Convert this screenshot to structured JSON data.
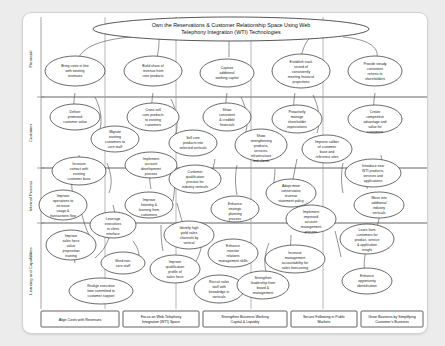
{
  "diagram": {
    "type": "strategy-map",
    "title": "Own the Reservations & Customer Relationship Space Using Web Telephony Integration (WTI) Technologies",
    "background_color": "#ececed",
    "panel_color": "#ffffff",
    "line_color": "#4a4a4a"
  },
  "perspectives": [
    {
      "id": "financial",
      "label": "Financial"
    },
    {
      "id": "customer",
      "label": "Customer"
    },
    {
      "id": "internal",
      "label": "Internal Process"
    },
    {
      "id": "learning",
      "label": "Learning and Capabilities"
    }
  ],
  "themes": [
    {
      "id": "theme-1",
      "label": "Align Costs with Revenues"
    },
    {
      "id": "theme-2",
      "label": "Focus on Web-Telephony Integration (WTI) Space"
    },
    {
      "id": "theme-3",
      "label": "Strengthen Business Working Capital & Liquidity"
    },
    {
      "id": "theme-4",
      "label": "Secure Following in Public Markets"
    },
    {
      "id": "theme-5",
      "label": "Grow Business by Simplifying Customer's Business"
    }
  ],
  "nodes": {
    "financial": [
      {
        "id": "f1",
        "label": "Bring costs in line with existing revenues"
      },
      {
        "id": "f2",
        "label": "Build share of revenue from core products"
      },
      {
        "id": "f3",
        "label": "Capture additional working capital"
      },
      {
        "id": "f4",
        "label": "Establish track record of consistently meeting financial projections"
      },
      {
        "id": "f5",
        "label": "Provide steady consistent returns to shareholders"
      }
    ],
    "customer": [
      {
        "id": "c1",
        "label": "Deliver promised customer value"
      },
      {
        "id": "c2",
        "label": "Migrate existing customers to core staff"
      },
      {
        "id": "c3",
        "label": "Cross-sell core products to existing customers"
      },
      {
        "id": "c4",
        "label": "Sell core products into selected verticals"
      },
      {
        "id": "c5",
        "label": "Show consistent & credible financials"
      },
      {
        "id": "c6",
        "label": "Show strengthening products, services, infrastructure and clients"
      },
      {
        "id": "c7",
        "label": "Proactively manage shareholder expectations"
      },
      {
        "id": "c8",
        "label": "Improve caliber of customer base and reference sites"
      },
      {
        "id": "c9",
        "label": "Create competitive advantage and value for customers"
      }
    ],
    "internal": [
      {
        "id": "i1",
        "label": "Increase contact with existing customer base"
      },
      {
        "id": "i2",
        "label": "Improve operations to increase usage & transactions flow"
      },
      {
        "id": "i3",
        "label": "Implement account development process"
      },
      {
        "id": "i4",
        "label": "Customer qualification process for industry verticals"
      },
      {
        "id": "i5",
        "label": "Improve listening & learning from customers"
      },
      {
        "id": "i6",
        "label": "Enhance strategic planning process"
      },
      {
        "id": "i7",
        "label": "Adopt more conservative revenue statement policy"
      },
      {
        "id": "i8",
        "label": "Implement improved account management process"
      },
      {
        "id": "i9",
        "label": "Introduce new WTI products, services and applications"
      },
      {
        "id": "i10",
        "label": "Move into additional industry verticals"
      }
    ],
    "learning": [
      {
        "id": "l1",
        "label": "Improve sales force value proposition training"
      },
      {
        "id": "l2",
        "label": "Leverage executives in client interface"
      },
      {
        "id": "l3",
        "label": "Shed non-core staff"
      },
      {
        "id": "l4",
        "label": "Realign executive time committed to customer support"
      },
      {
        "id": "l5",
        "label": "Identify high yield sales channels by vertical"
      },
      {
        "id": "l6",
        "label": "Improve qualification profile of sales force"
      },
      {
        "id": "l7",
        "label": "Recruit sales staff with knowledge in verticals"
      },
      {
        "id": "l8",
        "label": "Strengthen leadership from board & management"
      },
      {
        "id": "l9",
        "label": "Enhance investor relations management skills"
      },
      {
        "id": "l10",
        "label": "Increase management accountability for sales forecasting"
      },
      {
        "id": "l11",
        "label": "Learn from customers for product, service & application insight"
      },
      {
        "id": "l12",
        "label": "Enhance opportunity identification"
      }
    ]
  }
}
